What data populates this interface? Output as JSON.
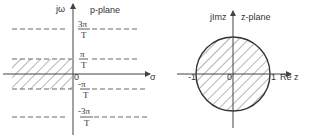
{
  "p_plane": {
    "title": "p-plane",
    "vertical_axis_label": "jω",
    "horizontal_axis_label": "σ",
    "origin_label": "0",
    "lines": [
      {
        "name": "3pi-over-T",
        "numerator": "3π",
        "denominator": "T"
      },
      {
        "name": "pi-over-T",
        "numerator": "π",
        "denominator": "T"
      },
      {
        "name": "minus-pi-over-T",
        "numerator": "-π",
        "denominator": "T"
      },
      {
        "name": "minus-3pi-over-T",
        "numerator": "-3π",
        "denominator": "T"
      }
    ],
    "shaded_region": "left half-plane strip between -π/T and π/T"
  },
  "z_plane": {
    "title": "z-plane",
    "vertical_axis_label": "jImz",
    "horizontal_axis_label": "Re z",
    "origin_label": "0",
    "tick_left": "-1",
    "tick_right": "1",
    "shaded_region": "unit circle interior"
  }
}
